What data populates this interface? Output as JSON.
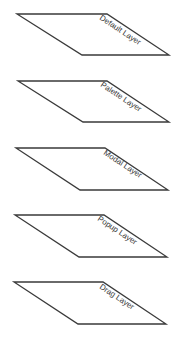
{
  "diagram": {
    "title": "",
    "line_color": "#3a3a3a",
    "text_color": "#3c3c3c",
    "layers": [
      {
        "label": "Default Layer",
        "points": [
          [
            17,
            14
          ],
          [
            107,
            14
          ],
          [
            169,
            55
          ],
          [
            82,
            55
          ]
        ],
        "label_pos": [
          99,
          19
        ]
      },
      {
        "label": "Palette Layer",
        "points": [
          [
            18,
            81
          ],
          [
            107,
            81
          ],
          [
            169,
            122
          ],
          [
            83,
            122
          ]
        ],
        "label_pos": [
          100,
          86
        ]
      },
      {
        "label": "Modal Layer",
        "points": [
          [
            16,
            148
          ],
          [
            105,
            148
          ],
          [
            168,
            190
          ],
          [
            80,
            190
          ]
        ],
        "label_pos": [
          103,
          154
        ]
      },
      {
        "label": "Popup Layer",
        "points": [
          [
            15,
            215
          ],
          [
            104,
            215
          ],
          [
            167,
            257
          ],
          [
            79,
            257
          ]
        ],
        "label_pos": [
          97,
          220
        ]
      },
      {
        "label": "Drag Layer",
        "points": [
          [
            14,
            282
          ],
          [
            103,
            282
          ],
          [
            166,
            324
          ],
          [
            78,
            324
          ]
        ],
        "label_pos": [
          99,
          288
        ]
      }
    ]
  }
}
